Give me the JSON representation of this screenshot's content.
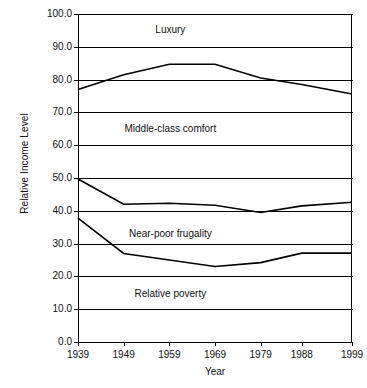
{
  "chart_data": {
    "type": "line",
    "title": "",
    "xlabel": "Year",
    "ylabel": "Relative Income Level",
    "categories": [
      "1939",
      "1949",
      "1959",
      "1969",
      "1979",
      "1988",
      "1999"
    ],
    "x": [
      1939,
      1949,
      1959,
      1969,
      1979,
      1988,
      1999
    ],
    "xlim": [
      1939,
      1999
    ],
    "ylim": [
      0.0,
      100.0
    ],
    "yticks": [
      "0.0",
      "10.0",
      "20.0",
      "30.0",
      "40.0",
      "50.0",
      "60.0",
      "70.0",
      "80.0",
      "90.0",
      "100.0"
    ],
    "ytick_values": [
      0.0,
      10.0,
      20.0,
      30.0,
      40.0,
      50.0,
      60.0,
      70.0,
      80.0,
      90.0,
      100.0
    ],
    "grid": true,
    "grid_axis": "y",
    "legend": "none",
    "series": [
      {
        "name": "Luxury / Middle-class comfort boundary",
        "values": [
          77.0,
          81.5,
          84.7,
          84.7,
          80.5,
          78.5,
          75.6
        ],
        "color": "#000000"
      },
      {
        "name": "Middle-class comfort / Near-poor frugality boundary",
        "values": [
          49.7,
          42.0,
          42.3,
          41.7,
          39.5,
          41.5,
          42.6
        ],
        "color": "#000000"
      },
      {
        "name": "Near-poor frugality / Relative poverty boundary",
        "values": [
          37.8,
          27.0,
          25.0,
          23.0,
          24.2,
          27.1,
          27.1
        ],
        "color": "#000000"
      }
    ],
    "annotations": [
      {
        "text": "Luxury",
        "x": 1959,
        "y": 95.0
      },
      {
        "text": "Middle-class comfort",
        "x": 1959,
        "y": 65.0
      },
      {
        "text": "Near-poor frugality",
        "x": 1959,
        "y": 33.0
      },
      {
        "text": "Relative poverty",
        "x": 1959,
        "y": 14.5
      }
    ]
  }
}
